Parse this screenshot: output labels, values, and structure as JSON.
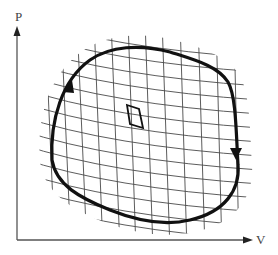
{
  "diagram": {
    "title": "",
    "type": "p-V diagram of a closed thermodynamic cycle subdivided by a grid of isotherms and adiabats",
    "axes": {
      "y": {
        "label": "P"
      },
      "x": {
        "label": "V"
      }
    },
    "cycle": {
      "direction": "clockwise",
      "arrows": [
        "left-side pointing up",
        "right-side pointing down"
      ]
    },
    "highlighted_cell": "small elementary Carnot cycle (parallelogram) near the center",
    "colors": {
      "axis": "#555555",
      "loop": "#111111",
      "grid": "#444444",
      "background": "#ffffff"
    }
  }
}
